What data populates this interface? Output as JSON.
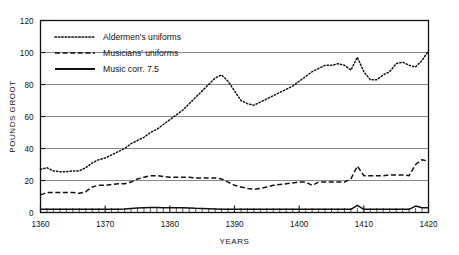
{
  "chart_data": {
    "type": "line",
    "title": "",
    "xlabel": "YEARS",
    "ylabel": "POUNDS GROOT",
    "xlim": [
      1360,
      1420
    ],
    "ylim": [
      0,
      120
    ],
    "grid": true,
    "legend_position": "top-left",
    "xticks": [
      1360,
      1370,
      1380,
      1390,
      1400,
      1410,
      1420
    ],
    "xtick_labels": [
      "1360",
      "1370",
      "1380",
      "1390",
      "1400",
      "1410",
      "1420"
    ],
    "yticks": [
      0,
      20,
      40,
      60,
      80,
      100,
      120
    ],
    "ytick_labels": [
      "0",
      "20",
      "40",
      "60",
      "80",
      "100",
      "120"
    ],
    "minor_xtick_step": 1,
    "x": [
      1360,
      1361,
      1362,
      1363,
      1364,
      1365,
      1366,
      1367,
      1368,
      1369,
      1370,
      1371,
      1372,
      1373,
      1374,
      1375,
      1376,
      1377,
      1378,
      1379,
      1380,
      1381,
      1382,
      1383,
      1384,
      1385,
      1386,
      1387,
      1388,
      1389,
      1390,
      1391,
      1392,
      1393,
      1394,
      1395,
      1396,
      1397,
      1398,
      1399,
      1400,
      1401,
      1402,
      1403,
      1404,
      1405,
      1406,
      1407,
      1408,
      1409,
      1410,
      1411,
      1412,
      1413,
      1414,
      1415,
      1416,
      1417,
      1418,
      1419,
      1420
    ],
    "series": [
      {
        "name": "Aldermen's uniforms",
        "style": "dotted",
        "color": "#111111",
        "values": [
          27,
          28,
          26,
          25.5,
          25.5,
          26,
          26,
          28,
          31,
          33,
          34,
          36,
          38,
          40,
          43,
          45,
          47,
          50,
          52,
          55,
          58,
          61,
          64,
          68,
          72,
          76,
          80,
          84,
          86,
          82,
          76,
          70,
          68,
          67,
          69,
          71,
          73,
          75,
          77,
          79,
          82,
          85,
          88,
          90,
          92,
          92,
          93,
          92,
          89,
          97,
          88,
          83,
          83,
          86,
          88,
          93,
          94,
          92,
          91,
          95,
          101
        ]
      },
      {
        "name": "Musicians' uniforms",
        "style": "dashed",
        "color": "#111111",
        "values": [
          11,
          12.5,
          12.5,
          12.5,
          12.5,
          12.5,
          12,
          13,
          16,
          17,
          17,
          17.5,
          18,
          18,
          19,
          21,
          22,
          23,
          23,
          22.5,
          22,
          22,
          22,
          22,
          21.5,
          21.5,
          21.5,
          21.5,
          21,
          19,
          17,
          16,
          15,
          14.5,
          15,
          16,
          17,
          17.5,
          18,
          18.5,
          19,
          19,
          17,
          19,
          19,
          19,
          19,
          19,
          21,
          29,
          23,
          23,
          23,
          23,
          23.5,
          23.5,
          23.5,
          23,
          30,
          33,
          32
        ]
      },
      {
        "name": "Music corr. 7.5",
        "style": "solid",
        "color": "#111111",
        "values": [
          2,
          2,
          2,
          2,
          2,
          2,
          2,
          2,
          2,
          2,
          2,
          2,
          2,
          2.2,
          2.5,
          2.8,
          3,
          3.2,
          3.2,
          3,
          3,
          3,
          3,
          2.8,
          2.6,
          2.5,
          2.4,
          2.2,
          2,
          2,
          2,
          2,
          2,
          2,
          2,
          2,
          2,
          2,
          2,
          2,
          2,
          2,
          2,
          2,
          2,
          2,
          2,
          2,
          2,
          4.5,
          2,
          2,
          2,
          2,
          2,
          2,
          2,
          2,
          4,
          3,
          3
        ]
      }
    ]
  },
  "legend": {
    "entries": [
      {
        "label": "Aldermen's uniforms",
        "style": "dotted"
      },
      {
        "label": "Musicians' uniforms",
        "style": "dashed"
      },
      {
        "label": "Music corr. 7.5",
        "style": "solid"
      }
    ]
  }
}
